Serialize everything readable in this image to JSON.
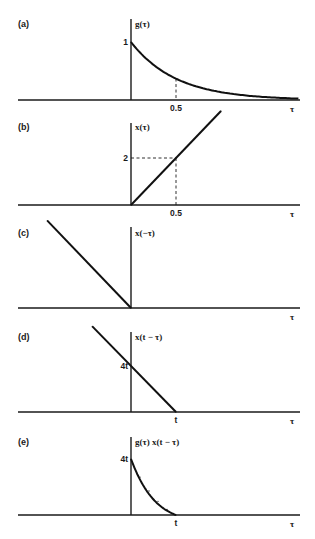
{
  "chart_data": [
    {
      "type": "line",
      "panel_label": "(a)",
      "ylabel": "g(τ)",
      "xlabel": "τ",
      "function": "exponential decay",
      "x_ticks": [
        {
          "value": 0.5,
          "label": "0.5"
        }
      ],
      "y_ticks": [
        {
          "value": 1,
          "label": "1"
        }
      ],
      "series": [
        {
          "name": "g(τ)",
          "x": [
            0,
            0.25,
            0.5,
            0.75,
            1.0,
            1.25,
            1.5,
            1.75
          ],
          "y": [
            1,
            0.61,
            0.37,
            0.22,
            0.14,
            0.08,
            0.05,
            0.03
          ]
        }
      ],
      "xlim": [
        -1.25,
        1.8
      ],
      "ylim": [
        0,
        1.25
      ],
      "guides": [
        {
          "x": 0.5,
          "y": 0.37,
          "dashed": "vertical"
        }
      ]
    },
    {
      "type": "line",
      "panel_label": "(b)",
      "ylabel": "x(τ)",
      "xlabel": "τ",
      "function": "linear ramp",
      "x_ticks": [
        {
          "value": 0.5,
          "label": "0.5"
        }
      ],
      "y_ticks": [
        {
          "value": 2,
          "label": "2"
        }
      ],
      "series": [
        {
          "name": "x(τ)",
          "x": [
            0,
            1.0
          ],
          "y": [
            0,
            4
          ]
        }
      ],
      "xlim": [
        -1.25,
        1.8
      ],
      "ylim": [
        0,
        4.2
      ],
      "guides": [
        {
          "x": 0.5,
          "y": 2,
          "dashed": "both"
        }
      ]
    },
    {
      "type": "line",
      "panel_label": "(c)",
      "ylabel": "x(−τ)",
      "xlabel": "τ",
      "function": "time-reversed ramp",
      "x_ticks": [],
      "y_ticks": [],
      "series": [
        {
          "name": "x(−τ)",
          "x": [
            -0.93,
            0
          ],
          "y": [
            3.72,
            0
          ]
        }
      ],
      "xlim": [
        -1.25,
        1.8
      ],
      "ylim": [
        0,
        4.2
      ],
      "guides": []
    },
    {
      "type": "line",
      "panel_label": "(d)",
      "ylabel": "x(t − τ)",
      "xlabel": "τ",
      "function": "shifted reversed ramp",
      "x_ticks": [
        {
          "value": 0.5,
          "label": "t"
        }
      ],
      "y_ticks": [
        {
          "value": 2,
          "label": "4t"
        }
      ],
      "series": [
        {
          "name": "x(t − τ)",
          "x": [
            -0.43,
            0.5
          ],
          "y": [
            3.72,
            0
          ]
        }
      ],
      "xlim": [
        -1.25,
        1.8
      ],
      "ylim": [
        0,
        4.2
      ],
      "guides": []
    },
    {
      "type": "line",
      "panel_label": "(e)",
      "ylabel": "g(τ) x(t − τ)",
      "xlabel": "τ",
      "function": "product",
      "x_ticks": [
        {
          "value": 0.5,
          "label": "t"
        }
      ],
      "y_ticks": [
        {
          "value": 2,
          "label": "4t"
        }
      ],
      "series": [
        {
          "name": "g(τ) x(t − τ)",
          "x": [
            0,
            0.1,
            0.2,
            0.3,
            0.4,
            0.5
          ],
          "y": [
            2,
            1.35,
            0.86,
            0.49,
            0.2,
            0
          ]
        }
      ],
      "xlim": [
        -1.25,
        1.8
      ],
      "ylim": [
        0,
        4.2
      ],
      "guides": []
    }
  ]
}
